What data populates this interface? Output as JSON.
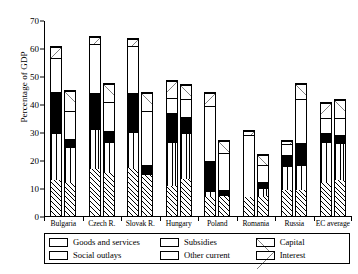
{
  "chart_data": {
    "type": "bar",
    "title": "",
    "xlabel": "",
    "ylabel": "Percentage of GDP",
    "ylim": [
      0,
      70
    ],
    "yticks": [
      0,
      10,
      20,
      30,
      40,
      50,
      60,
      70
    ],
    "grid": false,
    "legend_position": "bottom",
    "stacked": true,
    "bars_per_group": 2,
    "categories": [
      "Bulgaria",
      "Czech R.",
      "Slovak R.",
      "Hungary",
      "Poland",
      "Romania",
      "Russia",
      "EC average"
    ],
    "series": [
      {
        "name": "Goods and services",
        "pattern": "diagonal-hatch-forward",
        "values_bar1": [
          13.0,
          17.0,
          17.5,
          13.0,
          7.0,
          7.0,
          9.5,
          12.5
        ],
        "values_bar2": [
          12.0,
          15.5,
          15.0,
          13.5,
          7.5,
          7.5,
          9.5,
          13.0
        ]
      },
      {
        "name": "Social outlays",
        "pattern": "vertical-lines",
        "values_bar1": [
          17.0,
          14.5,
          13.0,
          19.5,
          2.0,
          0.0,
          9.0,
          14.5
        ],
        "values_bar2": [
          13.0,
          11.5,
          0.0,
          16.5,
          0.0,
          3.0,
          9.0,
          13.5
        ]
      },
      {
        "name": "Subsidies",
        "pattern": "solid-black",
        "values_bar1": [
          15.0,
          13.0,
          14.0,
          12.5,
          11.0,
          0.0,
          4.0,
          3.0
        ],
        "values_bar2": [
          3.0,
          4.0,
          3.5,
          6.0,
          2.0,
          2.0,
          8.0,
          3.0
        ]
      },
      {
        "name": "Other current",
        "pattern": "white",
        "values_bar1": [
          12.0,
          17.5,
          17.0,
          6.5,
          20.0,
          22.5,
          4.0,
          5.5
        ],
        "values_bar2": [
          10.0,
          10.5,
          19.5,
          6.5,
          13.5,
          6.5,
          16.0,
          6.0
        ]
      },
      {
        "name": "Capital",
        "pattern": "diagonal-backslash",
        "values_bar1": [
          0.0,
          0.0,
          0.0,
          0.0,
          0.0,
          0.0,
          0.0,
          0.0
        ],
        "values_bar2": [
          7.5,
          6.5,
          6.5,
          5.0,
          4.5,
          3.5,
          5.5,
          6.5
        ]
      },
      {
        "name": "Interest",
        "pattern": "diagonal-slash",
        "values_bar1": [
          4.0,
          2.5,
          2.5,
          7.5,
          4.5,
          1.5,
          1.0,
          5.5
        ],
        "values_bar2": [
          0.0,
          0.0,
          0.0,
          0.0,
          0.0,
          0.0,
          0.0,
          0.0
        ]
      }
    ],
    "bar1_totals": [
      61.0,
      64.5,
      64.0,
      49.0,
      44.5,
      31.0,
      27.5,
      41.0
    ],
    "bar2_totals": [
      45.5,
      48.0,
      44.5,
      47.5,
      27.5,
      22.5,
      48.0,
      42.0
    ]
  },
  "axis": {
    "ylabel": "Percentage of GDP",
    "ytick_labels": [
      "70",
      "60",
      "50",
      "40",
      "30",
      "20",
      "10",
      "0"
    ]
  },
  "xaxis": {
    "labels": [
      "Bulgaria",
      "Czech R.",
      "Slovak R.",
      "Hungary",
      "Poland",
      "Romania",
      "Russia",
      "EC average"
    ]
  },
  "legend": {
    "items": [
      {
        "label": "Goods and services",
        "pattern": "diagonal-hatch-forward"
      },
      {
        "label": "Social outlays",
        "pattern": "vertical-lines"
      },
      {
        "label": "Subsidies",
        "pattern": "solid-black"
      },
      {
        "label": "Other current",
        "pattern": "white"
      },
      {
        "label": "Capital",
        "pattern": "diagonal-backslash"
      },
      {
        "label": "Interest",
        "pattern": "diagonal-slash"
      }
    ]
  }
}
